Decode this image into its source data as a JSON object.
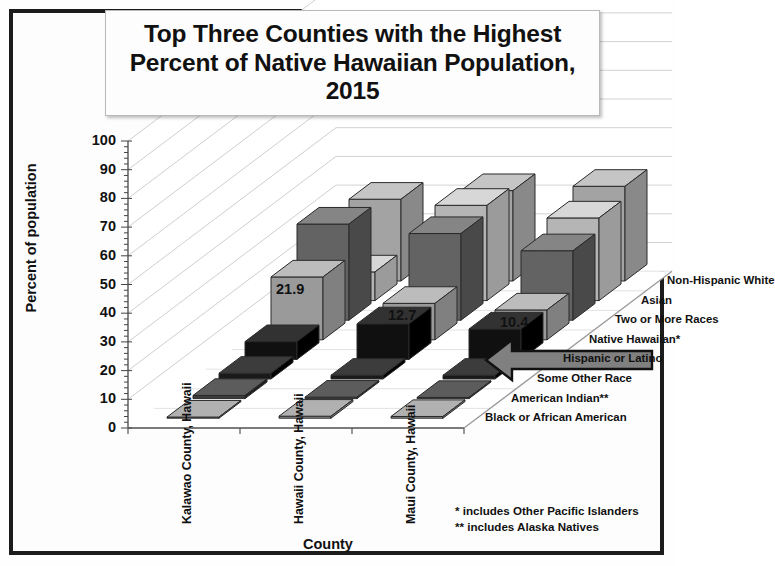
{
  "title": "Top Three Counties with the Highest Percent of Native Hawaiian Population, 2015",
  "axes": {
    "y_title": "Percent of population",
    "x_title": "County",
    "y_ticks": [
      "100",
      "90",
      "80",
      "70",
      "60",
      "50",
      "40",
      "30",
      "20",
      "10",
      "0"
    ]
  },
  "footnotes": {
    "line1": "* includes Other Pacific Islanders",
    "line2": "** includes Alaska Natives"
  },
  "annotation": {
    "arrow_name": "left-pointing-arrow",
    "arrow_color": "#808080",
    "points_to": "Native Hawaiian*"
  },
  "chart_data": {
    "type": "bar",
    "subtype": "3d-grouped-bar",
    "title": "Top Three Counties with the Highest Percent of Native Hawaiian Population, 2015",
    "xlabel": "County",
    "ylabel": "Percent of population",
    "ylim": [
      0,
      100
    ],
    "ytick_step": 10,
    "grid": true,
    "legend_position": "depth-axis-right",
    "categories": [
      "Kalawao County, Hawaii",
      "Hawaii County, Hawaii",
      "Maui County, Hawaii"
    ],
    "series": [
      {
        "name": "Black or African American",
        "shade": "#8f8f8f",
        "values": [
          0.4,
          0.7,
          0.6
        ],
        "labels": [
          "",
          "",
          ""
        ]
      },
      {
        "name": "American Indian**",
        "shade": "#3a3a3a",
        "values": [
          1.1,
          0.5,
          0.4
        ],
        "labels": [
          "",
          "",
          ""
        ]
      },
      {
        "name": "Some Other Race",
        "shade": "#1a1a1a",
        "values": [
          2.0,
          1.3,
          1.3
        ],
        "labels": [
          "",
          "",
          ""
        ]
      },
      {
        "name": "Hispanic or Latino",
        "shade": "#101010",
        "values": [
          6.2,
          12.4,
          10.6
        ],
        "labels": [
          "",
          "",
          ""
        ]
      },
      {
        "name": "Native Hawaiian*",
        "shade": "#9a9a9a",
        "values": [
          21.9,
          12.7,
          10.4
        ],
        "labels": [
          "21.9",
          "12.7",
          "10.4"
        ]
      },
      {
        "name": "Two or More Races",
        "shade": "#636363",
        "values": [
          33.5,
          30.2,
          24.2
        ],
        "labels": [
          "",
          "",
          ""
        ]
      },
      {
        "name": "Asian",
        "shade": "#b5b5b5",
        "values": [
          10.0,
          33.2,
          28.8
        ],
        "labels": [
          "",
          "",
          ""
        ]
      },
      {
        "name": "Non-Hispanic White",
        "shade": "#a3a3a3",
        "values": [
          28.5,
          31.5,
          33.0
        ],
        "labels": [
          "",
          "",
          ""
        ]
      }
    ]
  }
}
